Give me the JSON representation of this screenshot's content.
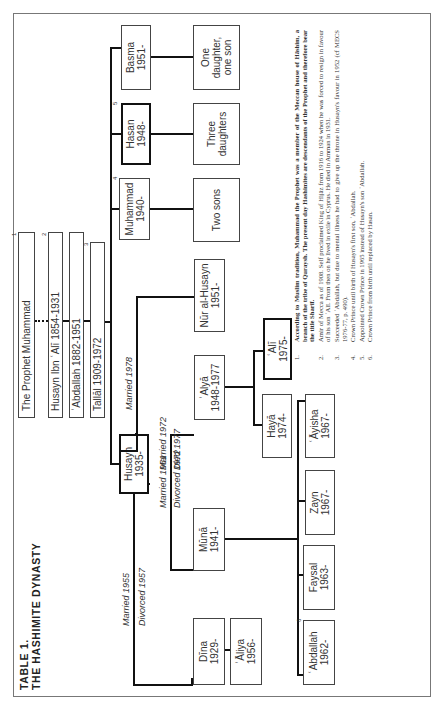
{
  "title": {
    "line1": "TABLE 1.",
    "line2": "THE HASHIMITE DYNASTY"
  },
  "ancestors": [
    {
      "label": "The Prophet Muhammad",
      "note": "1"
    },
    {
      "label": "Husayn Ibn ʿAlī 1854-1931",
      "note": "2"
    },
    {
      "label": "ʿAbdallah 1882-1951",
      "note": ""
    },
    {
      "label": "Tallāl 1909-1972",
      "note": "3"
    }
  ],
  "king": {
    "name": "Husayn",
    "years": "1935-"
  },
  "siblings": [
    {
      "name": "Muhammad",
      "years": "1940-",
      "note": "4",
      "children": "Two sons"
    },
    {
      "name": "Hasan",
      "years": "1948-",
      "note": "5",
      "children": "Three daughters"
    },
    {
      "name": "Basma",
      "years": "1951-",
      "note": "",
      "children": "One daughter, one son"
    }
  ],
  "marriages": [
    {
      "spouse": {
        "name": "Dīna",
        "years": "1929-"
      },
      "label1": "Married 1955",
      "label2": "Divorced 1957",
      "children": [
        {
          "name": "ʿĀliya",
          "years": "1956-"
        }
      ]
    },
    {
      "spouse": {
        "name": "Mūnā",
        "years": "1941-"
      },
      "label1": "Married 1961",
      "label2": "Divorced 1972",
      "children": [
        {
          "name": "ʿAbdallah",
          "years": "1962-",
          "note": "6"
        },
        {
          "name": "Faysal",
          "years": "1963-"
        },
        {
          "name": "Zayn",
          "years": "1967-"
        },
        {
          "name": "ʿĀyisha",
          "years": "1967-"
        }
      ]
    },
    {
      "spouse": {
        "name": "ʿAlyā",
        "years": "1948-1977"
      },
      "label1": "Married 1972",
      "label2": "Died 1977",
      "children": [
        {
          "name": "Hayā",
          "years": "1974-"
        },
        {
          "name": "ʿAlī",
          "years": "1975-"
        }
      ]
    },
    {
      "spouse": {
        "name": "Nūr al-Husayn",
        "years": "1951-"
      },
      "label1": "Married 1978",
      "label2": "",
      "children": []
    }
  ],
  "footnotes": [
    {
      "num": "1.",
      "text": "According to Muslim tradition, Muhammad the Prophet was a member of the Meccan house of Hāshim, a branch of the tribe of Quraysh. The present day Hashimites are descendants of the Prophet and therefore bear the title Sharīf.",
      "bold": true
    },
    {
      "num": "2.",
      "text": "Amir of Mecca as of 1908. Self proclaimed King of Hijāz from 1916 to 1924 when he was forced to resign in favour of his son ʿAlī. From then on he lived in exile in Cyprus. He died in Amman in 1931.",
      "bold": false
    },
    {
      "num": "3.",
      "text": "Succeeded ʿAbdallah, but due to mental illness he had to give up the throne in Husayn's favour in 1952 (cf MECS 1976-77, p. 490).",
      "bold": false
    },
    {
      "num": "4.",
      "text": "Crown Prince until birth of Husayn's first son, ʿAbdallah.",
      "bold": false
    },
    {
      "num": "5.",
      "text": "Appointed Crown Prince in 1965 instead of Husayn's son ʿAbdallah.",
      "bold": false
    },
    {
      "num": "6.",
      "text": "Crown Prince from birth until replaced by Hasan.",
      "bold": false
    }
  ]
}
